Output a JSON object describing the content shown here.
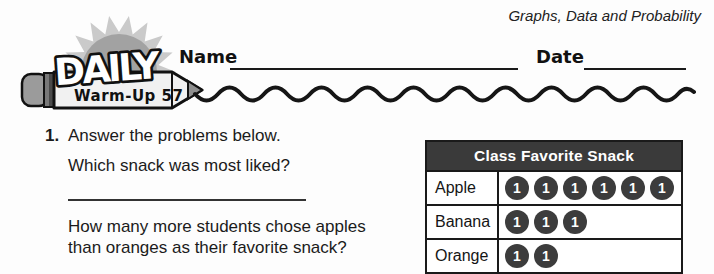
{
  "header": {
    "subject": "Graphs, Data and Probability",
    "name_label": "Name",
    "date_label": "Date"
  },
  "logo": {
    "title": "DAILY",
    "subtitle": "Warm-Up 57"
  },
  "question": {
    "number": "1.",
    "instruction": "Answer the problems below.",
    "prompt1": "Which snack was most liked?",
    "prompt2_line1": "How many more students chose apples",
    "prompt2_line2": "than oranges as their favorite snack?"
  },
  "chart_data": {
    "type": "table",
    "style": "pictograph",
    "title": "Class Favorite Snack",
    "categories": [
      "Apple",
      "Banana",
      "Orange"
    ],
    "values": [
      6,
      3,
      2
    ],
    "symbol_label": "1",
    "symbol_value": 1
  },
  "colors": {
    "table_header_bg": "#3a3a3a",
    "counter_bg": "#3c3c3c",
    "counter_text": "#ffffff",
    "ink": "#1a1a1a",
    "sun_rays": "#cacaca",
    "sun_core": "#a2a2a2",
    "pencil_body": "#f1f1f1",
    "eraser": "#9b9b9b"
  }
}
